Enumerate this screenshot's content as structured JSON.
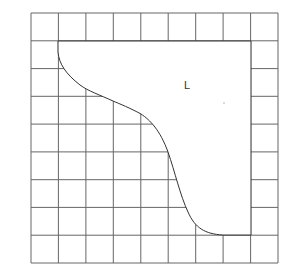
{
  "figure": {
    "type": "grid-with-cutout",
    "grid": {
      "rows": 9,
      "cols": 9,
      "left": 31,
      "top": 13,
      "right": 278,
      "bottom": 263,
      "line_color": "#555555"
    },
    "region": {
      "label": "L",
      "label_x": 186,
      "label_y": 86,
      "curve_color": "#333333",
      "boundary": "top edge along row-1 line, right edge along column-8 line, curved lower-left boundary from (58,41) to (251,235)"
    },
    "dot": {
      "x": 224,
      "y": 103
    }
  }
}
